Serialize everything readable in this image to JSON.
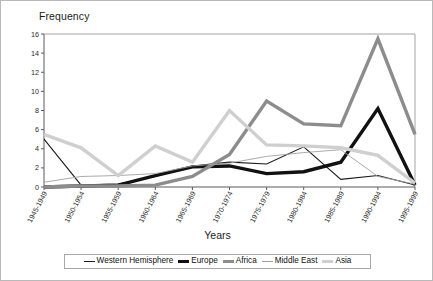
{
  "chart_data": {
    "type": "line",
    "title": "",
    "ylabel": "Frequency",
    "xlabel": "Years",
    "ylim": [
      0,
      16
    ],
    "yticks": [
      0,
      2,
      4,
      6,
      8,
      10,
      12,
      14,
      16
    ],
    "grid": false,
    "legend_position": "bottom",
    "categories": [
      "1945-1949",
      "1950-1954",
      "1955-1959",
      "1960-1964",
      "1965-1969",
      "1970-1974",
      "1975-1979",
      "1980-1984",
      "1985-1989",
      "1990-1994",
      "1995-1999"
    ],
    "series": [
      {
        "name": "Western Hemisphere",
        "color": "#1a1a1a",
        "width": 1.1,
        "values": [
          5,
          0.2,
          0.3,
          1.1,
          2.2,
          2.6,
          2.4,
          4.2,
          0.8,
          1.2,
          0.2
        ]
      },
      {
        "name": "Europe",
        "color": "#111111",
        "width": 3.4,
        "values": [
          0,
          0.1,
          0.2,
          1.2,
          2.1,
          2.2,
          1.4,
          1.6,
          2.6,
          8.2,
          0.2
        ]
      },
      {
        "name": "Africa",
        "color": "#8c8c8c",
        "width": 3.4,
        "values": [
          0,
          0.1,
          0.1,
          0.2,
          1.1,
          3.4,
          9,
          6.6,
          6.4,
          15.5,
          5.5
        ]
      },
      {
        "name": "Middle East",
        "color": "#a0a0a0",
        "width": 0.9,
        "values": [
          0.5,
          1.1,
          1.2,
          1.4,
          2.2,
          2.5,
          3.2,
          3.6,
          3.9,
          1.1,
          0.3
        ]
      },
      {
        "name": "Asia",
        "color": "#cfcfcf",
        "width": 3.4,
        "values": [
          5.5,
          4.1,
          1.2,
          4.3,
          2.6,
          8,
          4.4,
          4.3,
          4.1,
          3.3,
          0.4
        ]
      }
    ]
  },
  "legend": {
    "items": [
      {
        "label": "Western Hemisphere",
        "marker": "thin-black-line"
      },
      {
        "label": "Europe",
        "marker": "thick-black-line"
      },
      {
        "label": "Africa",
        "marker": "thick-gray-line"
      },
      {
        "label": "Middle East",
        "marker": "thin-gray-line"
      },
      {
        "label": "Asia",
        "marker": "thin-light-gray-line"
      }
    ]
  }
}
